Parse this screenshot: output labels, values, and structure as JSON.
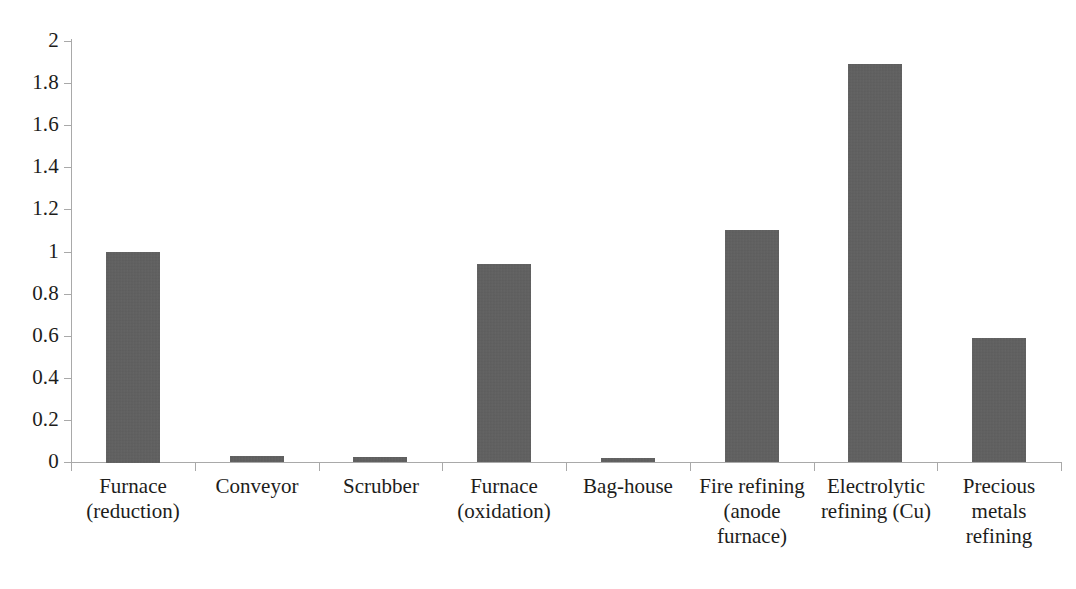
{
  "chart_data": {
    "type": "bar",
    "title": "",
    "subtitle": "",
    "xlabel": "",
    "ylabel": "",
    "ylim": [
      0,
      2
    ],
    "grid": false,
    "legend": null,
    "legend_position": "none",
    "bar_color": "#5d5d5d",
    "axis_color": "#a9a9a9",
    "text_color": "#1d1d1b",
    "categories": [
      "Furnace\n(reduction)",
      "Conveyor",
      "Scrubber",
      "Furnace\n(oxidation)",
      "Bag-house",
      "Fire refining\n(anode\nfurnace)",
      "Electrolytic\nrefining (Cu)",
      "Precious\nmetals\nrefining"
    ],
    "values": [
      1.0,
      0.028,
      0.022,
      0.94,
      0.02,
      1.1,
      1.89,
      0.59
    ],
    "ytick_labels": [
      "2",
      "1.8",
      "1.6",
      "1.4",
      "1.2",
      "1",
      "0.8",
      "0.6",
      "0.4",
      "0.2",
      "0"
    ],
    "ytick_values": [
      2,
      1.8,
      1.6,
      1.4,
      1.2,
      1,
      0.8,
      0.6,
      0.4,
      0.2,
      0
    ]
  }
}
